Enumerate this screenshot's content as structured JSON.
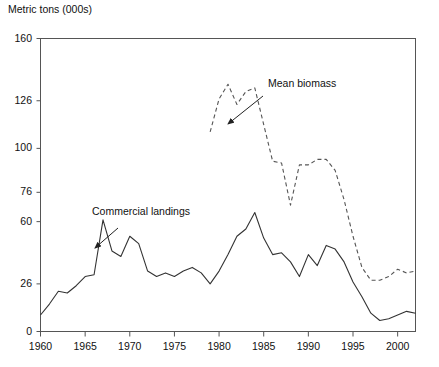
{
  "chart_data": {
    "type": "line",
    "title": "",
    "ylabel": "Metric tons (000s)",
    "xlabel": "",
    "ylim": [
      0,
      160
    ],
    "xlim": [
      1960,
      2002
    ],
    "grid": false,
    "legend_position": "inline-annotations",
    "ytick_labels": [
      "160",
      "126",
      "100",
      "76",
      "60",
      "26",
      "0"
    ],
    "ytick_values": [
      160,
      126,
      100,
      76,
      60,
      26,
      0
    ],
    "xtick_labels": [
      "1960",
      "1965",
      "1970",
      "1975",
      "1980",
      "1985",
      "1990",
      "1995",
      "2000"
    ],
    "xtick_values": [
      1960,
      1965,
      1970,
      1975,
      1980,
      1985,
      1990,
      1995,
      2000
    ],
    "annotations": [
      {
        "text": "Commercial landings",
        "points_to_series": "Commercial landings",
        "points_to_x": 1967
      },
      {
        "text": "Mean biomass",
        "points_to_series": "Mean biomass",
        "points_to_x": 1985
      }
    ],
    "series": [
      {
        "name": "Commercial landings",
        "style": "solid",
        "color": "#333333",
        "x": [
          1960,
          1961,
          1962,
          1963,
          1964,
          1965,
          1966,
          1967,
          1968,
          1969,
          1970,
          1971,
          1972,
          1973,
          1974,
          1975,
          1976,
          1977,
          1978,
          1979,
          1980,
          1981,
          1982,
          1983,
          1984,
          1985,
          1986,
          1987,
          1988,
          1989,
          1990,
          1991,
          1992,
          1993,
          1994,
          1995,
          1996,
          1997,
          1998,
          1999,
          2000,
          2001,
          2002
        ],
        "y": [
          9,
          15,
          22,
          21,
          25,
          30,
          31,
          61,
          44,
          41,
          52,
          48,
          33,
          30,
          32,
          30,
          33,
          35,
          32,
          26,
          33,
          42,
          52,
          56,
          65,
          51,
          42,
          43,
          38,
          30,
          42,
          36,
          47,
          45,
          38,
          27,
          19,
          10,
          6,
          7,
          9,
          11,
          10
        ]
      },
      {
        "name": "Mean biomass",
        "style": "dashed",
        "color": "#555555",
        "x": [
          1979,
          1980,
          1981,
          1982,
          1983,
          1984,
          1985,
          1986,
          1987,
          1988,
          1989,
          1990,
          1991,
          1992,
          1993,
          1994,
          1995,
          1996,
          1997,
          1998,
          1999,
          2000,
          2001,
          2002
        ],
        "y": [
          109,
          127,
          135,
          124,
          131,
          133,
          113,
          93,
          92,
          69,
          91,
          91,
          94,
          94,
          88,
          72,
          52,
          35,
          28,
          28,
          30,
          34,
          32,
          33
        ]
      }
    ]
  }
}
